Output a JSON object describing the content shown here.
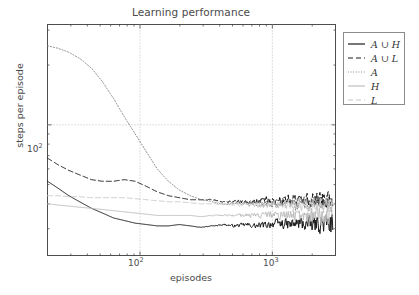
{
  "chart_data": {
    "type": "line",
    "title": "Learning performance",
    "xlabel": "episodes",
    "ylabel": "steps per episode",
    "xscale": "log",
    "yscale": "log",
    "xlim": [
      20,
      3000
    ],
    "ylim": [
      22,
      320
    ],
    "xticks": [
      "10²",
      "10³"
    ],
    "xtick_values": [
      100,
      1000
    ],
    "yticks": [
      "10²"
    ],
    "ytick_values": [
      100
    ],
    "grid": true,
    "grid_style": "dotted",
    "legend_position": "upper right outside",
    "series": [
      {
        "name": "A∪H",
        "legend_label": "A ∪ H",
        "linestyle": "solid",
        "color": "#1a1a1a",
        "x": [
          20,
          24,
          29,
          35,
          43,
          52,
          63,
          76,
          92,
          112,
          135,
          164,
          198,
          240,
          290,
          351,
          425,
          514,
          622,
          753,
          911,
          1102,
          1334,
          1614,
          1953,
          2363,
          2860
        ],
        "y": [
          52,
          48,
          44,
          41,
          38,
          36,
          34,
          33,
          32,
          31.5,
          31,
          31,
          31.5,
          31,
          30.5,
          31,
          31.5,
          31,
          31.5,
          31,
          31.5,
          32,
          31.5,
          32,
          31.5,
          32,
          31.5
        ]
      },
      {
        "name": "A∪L",
        "legend_label": "A ∪ L",
        "linestyle": "dashed",
        "color": "#1a1a1a",
        "x": [
          20,
          24,
          29,
          35,
          43,
          52,
          63,
          76,
          92,
          112,
          135,
          164,
          198,
          240,
          290,
          351,
          425,
          514,
          622,
          753,
          911,
          1102,
          1334,
          1614,
          1953,
          2363,
          2860
        ],
        "y": [
          68,
          63,
          59,
          56,
          53,
          52,
          52,
          53,
          52,
          49,
          46,
          44,
          43,
          42,
          42,
          42,
          41,
          41,
          41,
          41,
          42,
          41.5,
          42,
          42,
          42,
          42.5,
          42
        ]
      },
      {
        "name": "A",
        "legend_label": "A",
        "linestyle": "dotted",
        "color": "#7d7d7d",
        "x": [
          20,
          24,
          29,
          35,
          43,
          52,
          63,
          76,
          92,
          112,
          135,
          164,
          198,
          240,
          290,
          351,
          425,
          514,
          622,
          753,
          911,
          1102,
          1334,
          1614,
          1953,
          2363,
          2860
        ],
        "y": [
          250,
          243,
          232,
          216,
          193,
          165,
          136,
          110,
          90,
          73,
          60,
          52,
          47,
          44,
          42,
          41,
          40,
          40,
          40,
          40,
          40,
          40,
          40,
          40,
          40,
          40,
          40
        ]
      },
      {
        "name": "H",
        "legend_label": "H",
        "linestyle": "solid",
        "color": "#b8b8b8",
        "x": [
          20,
          24,
          29,
          35,
          43,
          52,
          63,
          76,
          92,
          112,
          135,
          164,
          198,
          240,
          290,
          351,
          425,
          514,
          622,
          753,
          911,
          1102,
          1334,
          1614,
          1953,
          2363,
          2860
        ],
        "y": [
          40,
          39.5,
          39,
          38.5,
          38,
          37.5,
          37,
          36.5,
          36,
          35.5,
          35,
          35,
          35,
          35,
          34.5,
          35,
          35,
          35,
          35,
          35,
          35.5,
          35,
          35,
          35,
          35,
          35,
          35
        ]
      },
      {
        "name": "L",
        "legend_label": "L",
        "linestyle": "dashed",
        "color": "#c4c4c4",
        "x": [
          20,
          24,
          29,
          35,
          43,
          52,
          63,
          76,
          92,
          112,
          135,
          164,
          198,
          240,
          290,
          351,
          425,
          514,
          622,
          753,
          911,
          1102,
          1334,
          1614,
          1953,
          2363,
          2860
        ],
        "y": [
          44,
          44,
          43.5,
          43.5,
          43,
          43,
          43,
          43,
          42.5,
          42,
          41.5,
          41,
          41,
          40.5,
          40,
          40,
          40,
          39.5,
          39.5,
          39.5,
          39.5,
          39.5,
          39.5,
          39.5,
          39.5,
          39.5,
          39.5
        ]
      }
    ],
    "noise": {
      "description": "series become increasingly noisy toward larger episode counts",
      "start_x": 200,
      "max_amplitude_frac": 0.16
    }
  },
  "legend": {
    "entries": [
      {
        "label": "A ∪ H",
        "style": "solid-dark"
      },
      {
        "label": "A ∪ L",
        "style": "dashed-dark"
      },
      {
        "label": "A",
        "style": "dotted-gray"
      },
      {
        "label": "H",
        "style": "solid-lightgray"
      },
      {
        "label": "L",
        "style": "dashed-lightgray"
      }
    ]
  },
  "axes": {
    "x_tick_labels": [
      "10",
      "10"
    ],
    "x_tick_exponents": [
      "2",
      "3"
    ],
    "y_tick_label": "10",
    "y_tick_exponent": "2"
  },
  "colors": {
    "axis": "#4d4d4d",
    "grid": "#b0b0b0",
    "text": "#4a4a4a",
    "dark_series": "#1a1a1a",
    "mid_series": "#7d7d7d",
    "light_series": "#b8b8b8"
  }
}
